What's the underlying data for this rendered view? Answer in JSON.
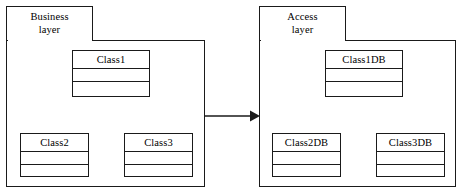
{
  "diagram": {
    "type": "uml-package-diagram",
    "width": 462,
    "height": 196,
    "background_color": "#ffffff",
    "line_color": "#1a1a1a",
    "text_color": "#000000"
  },
  "packages": [
    {
      "id": "business-layer",
      "tab_label": "Business\nlayer",
      "tab_label_line1": "Business",
      "tab_label_line2": "layer",
      "classes": [
        {
          "id": "class1",
          "name": "Class1",
          "attributes": [],
          "operations": []
        },
        {
          "id": "class2",
          "name": "Class2",
          "attributes": [],
          "operations": []
        },
        {
          "id": "class3",
          "name": "Class3",
          "attributes": [],
          "operations": []
        }
      ]
    },
    {
      "id": "access-layer",
      "tab_label": "Access\nlayer",
      "tab_label_line1": "Access",
      "tab_label_line2": "layer",
      "classes": [
        {
          "id": "class1db",
          "name": "Class1DB",
          "attributes": [],
          "operations": []
        },
        {
          "id": "class2db",
          "name": "Class2DB",
          "attributes": [],
          "operations": []
        },
        {
          "id": "class3db",
          "name": "Class3DB",
          "attributes": [],
          "operations": []
        }
      ]
    }
  ],
  "connectors": [
    {
      "id": "business-to-access",
      "kind": "dependency-arrow",
      "from": "business-layer",
      "to": "access-layer",
      "line_style": "solid",
      "arrowhead": "filled-triangle",
      "label": ""
    }
  ]
}
